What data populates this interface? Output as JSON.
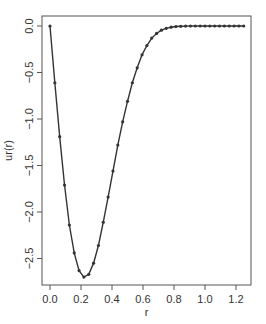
{
  "chart_data": {
    "type": "line",
    "title": "",
    "xlabel": "r",
    "ylabel": "ur(r)",
    "xlim": [
      -0.04,
      1.3
    ],
    "ylim": [
      -2.8,
      0.11
    ],
    "grid": false,
    "legend": null,
    "x_ticks": [
      0.0,
      0.2,
      0.4,
      0.6,
      0.8,
      1.0,
      1.2
    ],
    "x_tick_labels": [
      "0.0",
      "0.2",
      "0.4",
      "0.6",
      "0.8",
      "1.0",
      "1.2"
    ],
    "y_ticks": [
      0.0,
      -0.5,
      -1.0,
      -1.5,
      -2.0,
      -2.5
    ],
    "y_tick_labels": [
      "0.0",
      "-0.5",
      "-1.0",
      "-1.5",
      "-2.0",
      "-2.5"
    ],
    "series": [
      {
        "name": "ur(r)",
        "marker": "point",
        "color": "#333333",
        "x": [
          0.0,
          0.03125,
          0.0625,
          0.09375,
          0.125,
          0.15625,
          0.1875,
          0.21875,
          0.25,
          0.28125,
          0.3125,
          0.34375,
          0.375,
          0.40625,
          0.4375,
          0.46875,
          0.5,
          0.53125,
          0.5625,
          0.59375,
          0.625,
          0.65625,
          0.6875,
          0.71875,
          0.75,
          0.78125,
          0.8125,
          0.84375,
          0.875,
          0.90625,
          0.9375,
          0.96875,
          1.0,
          1.03125,
          1.0625,
          1.09375,
          1.125,
          1.15625,
          1.1875,
          1.21875,
          1.25
        ],
        "values": [
          0.0,
          -0.61,
          -1.19,
          -1.71,
          -2.14,
          -2.44,
          -2.63,
          -2.7,
          -2.67,
          -2.55,
          -2.36,
          -2.11,
          -1.84,
          -1.56,
          -1.28,
          -1.03,
          -0.81,
          -0.61,
          -0.45,
          -0.31,
          -0.21,
          -0.13,
          -0.08,
          -0.045,
          -0.025,
          -0.013,
          -0.006,
          -0.003,
          -0.001,
          0.0,
          0.0,
          0.0,
          0.0,
          0.0,
          0.0,
          0.0,
          0.0,
          0.0,
          0.0,
          0.0,
          0.0
        ]
      }
    ]
  },
  "plot_area": {
    "left": 42,
    "top": 16,
    "right": 251,
    "bottom": 285
  },
  "colors": {
    "line": "#333333",
    "axis": "#555555",
    "text": "#333333"
  }
}
